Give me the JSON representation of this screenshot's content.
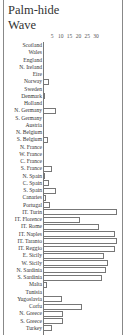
{
  "chart_data": {
    "type": "bar",
    "orientation": "horizontal",
    "title": "Palm-hide Wave",
    "xlabel": "",
    "ylabel": "",
    "xticks": [
      5,
      10,
      15,
      20,
      25,
      30
    ],
    "xlim": [
      0,
      40
    ],
    "grid": false,
    "legend": null,
    "categories": [
      "Scotland",
      "Wales",
      "England",
      "N. Ireland",
      "Eire",
      "Norway",
      "Sweden",
      "Denmark",
      "Holland",
      "N. Germany",
      "S. Germany",
      "Austria",
      "N. Belgium",
      "S. Belgium",
      "N. France",
      "W. France",
      "C. France",
      "S. France",
      "N. Spain",
      "C. Spain",
      "S. Spain",
      "Canaries",
      "Portugal",
      "IT. Turin",
      "IT. Florence",
      "IT. Rome",
      "IT. Naples",
      "IT. Taranto",
      "IT. Reggio",
      "E. Sicily",
      "W. Sicily",
      "N. Sardinia",
      "S. Sardinia",
      "Malta",
      "Tunisia",
      "Yugoslavia",
      "Corfu",
      "N. Greece",
      "S. Greece",
      "Turkey"
    ],
    "values": [
      0,
      0,
      0,
      0,
      0,
      3,
      0,
      1,
      0,
      7,
      0,
      0,
      0,
      2.5,
      0,
      0,
      0,
      5,
      1,
      3,
      7,
      1.5,
      4,
      40,
      20,
      30,
      39,
      40,
      39,
      33,
      35,
      34,
      32,
      2,
      0,
      10,
      21,
      11,
      11,
      5
    ]
  },
  "chart": {
    "title": "Palm-hide\nWave",
    "title_line1": "Palm-hide",
    "title_line2": "Wave",
    "ticks": [
      "5",
      "10",
      "15",
      "20",
      "25",
      "30"
    ]
  }
}
